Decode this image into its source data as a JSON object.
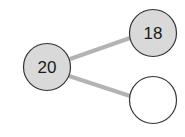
{
  "diagram": {
    "type": "number-bond",
    "colors": {
      "filled_circle": "#d9d9d9",
      "empty_circle": "#ffffff",
      "stroke": "#333333",
      "connector": "#b3b3b3"
    },
    "whole": {
      "label": "20"
    },
    "parts": [
      {
        "label": "18"
      },
      {
        "label": ""
      }
    ]
  }
}
